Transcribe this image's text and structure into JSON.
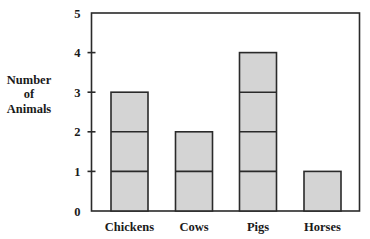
{
  "chart_data": {
    "type": "bar",
    "title": "",
    "xlabel": "",
    "ylabel": "Number of Animals",
    "ylabel_lines": [
      "Number",
      "of",
      "Animals"
    ],
    "categories": [
      "Chickens",
      "Cows",
      "Pigs",
      "Horses"
    ],
    "values": [
      3,
      2,
      4,
      1
    ],
    "ylim": [
      0,
      5
    ],
    "yticks": [
      0,
      1,
      2,
      3,
      4,
      5
    ],
    "grid": false,
    "legend": null,
    "bar_style": "stacked unit blocks (each bar divided at every integer)",
    "colors": {
      "bar_fill": "#d4d4d4",
      "bar_stroke": "#2a2a2a",
      "axis": "#2a2a2a",
      "text": "#1a1a1a",
      "background": "#ffffff"
    }
  }
}
